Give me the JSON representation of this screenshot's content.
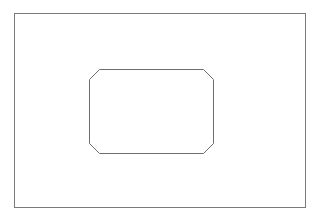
{
  "diagram": {
    "outer_frame": {
      "x": 14,
      "y": 13,
      "width": 291,
      "height": 194,
      "stroke": "#7a7a7a"
    },
    "inner_shape": {
      "type": "chamfered-rectangle",
      "x": 89,
      "y": 69,
      "width": 124,
      "height": 84,
      "chamfer": 10,
      "stroke": "#6e6e6e"
    },
    "background": "#ffffff"
  }
}
